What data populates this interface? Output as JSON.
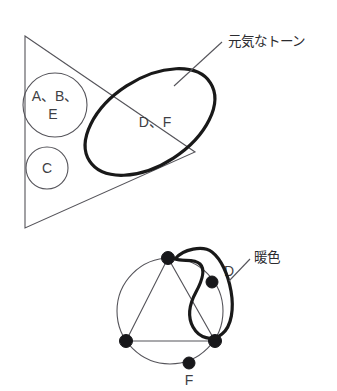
{
  "figure": {
    "background_color": "#ffffff",
    "thin_line_color": "#55545a",
    "thick_line_color": "#191919",
    "dot_color": "#17171a",
    "text_color": "#3a3a3e"
  },
  "upper_diagram": {
    "group_circles": [
      {
        "id": "group-abe",
        "line1": "A、B、",
        "line2": "E"
      },
      {
        "id": "group-c",
        "line1": "C",
        "line2": ""
      }
    ],
    "inner_label": "D、F",
    "callout": {
      "text": "元気なトーン"
    }
  },
  "lower_diagram": {
    "vertex_labels": {
      "d": "D",
      "f": "F"
    },
    "callout": {
      "text": "暖色"
    }
  }
}
